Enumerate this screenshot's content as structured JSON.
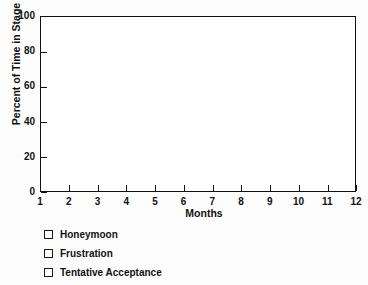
{
  "chart_data": {
    "type": "line",
    "title": "",
    "xlabel": "Months",
    "ylabel": "Percent of Time in Stage",
    "xlim": [
      1,
      12
    ],
    "ylim": [
      0,
      100
    ],
    "x_ticks": [
      "1",
      "2",
      "3",
      "4",
      "5",
      "6",
      "7",
      "8",
      "9",
      "10",
      "11",
      "12"
    ],
    "x_tick_values": [
      1,
      2,
      3,
      4,
      5,
      6,
      7,
      8,
      9,
      10,
      11,
      12
    ],
    "y_ticks": [
      "0",
      "20",
      "40",
      "60",
      "80",
      "100"
    ],
    "y_tick_values": [
      0,
      20,
      40,
      60,
      80,
      100
    ],
    "grid": false,
    "legend_position": "below-left",
    "series": [
      {
        "name": "Honeymoon",
        "marker": "open-square",
        "color": "#ffffff",
        "edge_color": "#1a1a1a",
        "values": []
      },
      {
        "name": "Frustration",
        "marker": "open-square",
        "color": "#ffffff",
        "edge_color": "#1a1a1a",
        "values": []
      },
      {
        "name": "Tentative Acceptance",
        "marker": "open-square",
        "color": "#ffffff",
        "edge_color": "#1a1a1a",
        "values": []
      }
    ],
    "annotations": []
  },
  "axes": {
    "y_title": "Percent of Time in Stage",
    "x_title": "Months"
  },
  "legend": {
    "items": [
      {
        "label": "Honeymoon",
        "swatch": "open-square-marker"
      },
      {
        "label": "Frustration",
        "swatch": "open-square-marker"
      },
      {
        "label": "Tentative Acceptance",
        "swatch": "open-square-marker"
      }
    ]
  },
  "colors": {
    "axis": "#111111",
    "plot_background": "#ffffff",
    "figure_background": "#fdfdfd",
    "marker_edge": "#1a1a1a",
    "marker_fill": "#ffffff"
  }
}
